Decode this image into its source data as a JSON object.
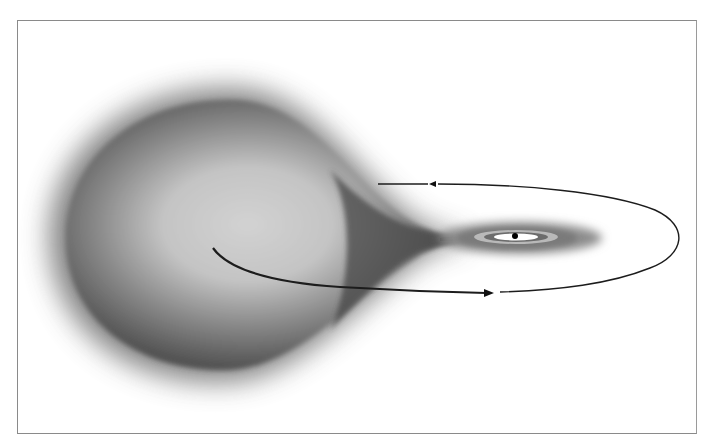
{
  "diagram": {
    "subject": "binary star mass transfer",
    "elements": [
      {
        "id": "donor-star",
        "label": "Roche-lobe-filling donor star",
        "shape": "teardrop",
        "center": [
          213,
          238
        ],
        "color": "#5e5e5e"
      },
      {
        "id": "accretion-stream",
        "label": "mass transfer stream through inner Lagrangian point",
        "from": [
          400,
          240
        ],
        "to": [
          470,
          238
        ]
      },
      {
        "id": "accretion-disk",
        "label": "accretion disk",
        "shape": "ellipse",
        "center": [
          515,
          238
        ],
        "rx": 80,
        "ry": 14,
        "color": "#6a6a6a"
      },
      {
        "id": "compact-object",
        "label": "compact object",
        "shape": "dot",
        "center": [
          515,
          236
        ],
        "color": "#000000"
      },
      {
        "id": "orbit-path",
        "label": "orbital path",
        "shape": "ellipse-arc",
        "direction": "counter-clockwise as seen",
        "color": "#1a1a1a"
      }
    ],
    "arrows": [
      {
        "id": "orbit-arrow-top",
        "position": [
          432,
          185
        ],
        "direction": "left"
      },
      {
        "id": "orbit-arrow-bottom",
        "position": [
          490,
          292
        ],
        "direction": "right"
      }
    ],
    "frame": {
      "x": 17,
      "y": 20,
      "width": 680,
      "height": 414,
      "border_color": "#8a8a8a"
    }
  }
}
